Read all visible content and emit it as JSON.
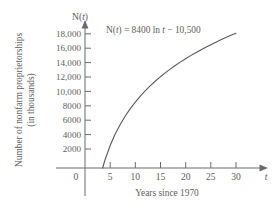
{
  "chart_data": {
    "type": "line",
    "title": "",
    "subtitle": "",
    "xlabel": "Years since 1970",
    "ylabel_line1": "Number of nonfarm proprietorships",
    "ylabel_line2": "(in thousands)",
    "x_variable": "t",
    "y_variable_name": "N",
    "y_variable_label": "N(t)",
    "equation_text": "N(t) = 8400 ln t − 10,500",
    "equation_parts": {
      "prefix": "N(",
      "var1": "t",
      "mid": ") = 8400 ln ",
      "var2": "t",
      "suffix": " − 10,500"
    },
    "formula": {
      "coefficient": 8400,
      "function": "ln",
      "constant": -10500
    },
    "xlim": [
      0,
      33
    ],
    "ylim": [
      0,
      19000
    ],
    "x_ticks": [
      0,
      5,
      10,
      15,
      20,
      25,
      30
    ],
    "x_tick_labels": [
      "0",
      "5",
      "10",
      "15",
      "20",
      "25",
      "30"
    ],
    "y_ticks": [
      2000,
      4000,
      6000,
      8000,
      10000,
      12000,
      14000,
      16000,
      18000
    ],
    "y_tick_labels": [
      "2000",
      "4000",
      "6000",
      "8000",
      "10,000",
      "12,000",
      "14,000",
      "16,000",
      "18,000"
    ],
    "grid": false,
    "legend": "none",
    "x_root": 3.51,
    "series": [
      {
        "name": "N(t) = 8400 ln t - 10,500",
        "color": "#585858",
        "x": [
          3.51,
          4,
          5,
          6,
          7,
          8,
          9,
          10,
          11,
          12,
          13,
          14,
          15,
          16,
          17,
          18,
          19,
          20,
          21,
          22,
          23,
          24,
          25,
          26,
          27,
          28,
          29,
          30
        ],
        "y": [
          0,
          1145,
          3019,
          4550,
          5845,
          6966,
          7955,
          8840,
          9641,
          10371,
          11044,
          11666,
          12246,
          12788,
          13297,
          13777,
          14231,
          14663,
          15073,
          15464,
          15838,
          16196,
          16540,
          16870,
          17188,
          17494,
          17790,
          18076
        ]
      }
    ],
    "annotations": [
      {
        "name": "equation-label",
        "text": "N(t) = 8400 ln t − 10,500",
        "x_position": 10.5,
        "y_position": 18400
      }
    ]
  },
  "axis_marks": {
    "y_axis_arrow": "arrow-up",
    "x_axis_arrow": "arrow-right"
  }
}
